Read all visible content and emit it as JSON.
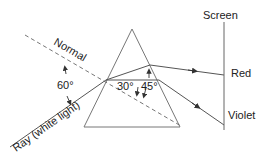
{
  "diagram": {
    "labels": {
      "screen": "Screen",
      "normal": "Normal",
      "ray": "Ray (white light)",
      "red": "Red",
      "violet": "Violet",
      "angle_incidence": "60°",
      "angle_red": "30°",
      "angle_violet": "45°"
    },
    "colors": {
      "line": "#555555",
      "text": "#222222",
      "dashed": "#666666"
    }
  }
}
